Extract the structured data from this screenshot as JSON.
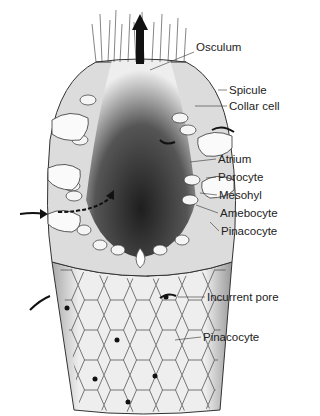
{
  "diagram": {
    "labels": [
      {
        "id": "osculum",
        "text": "Osculum",
        "x": 196,
        "y": 47
      },
      {
        "id": "spicule",
        "text": "Spicule",
        "x": 229,
        "y": 86
      },
      {
        "id": "collar-cell",
        "text": "Collar cell",
        "x": 229,
        "y": 102
      },
      {
        "id": "atrium",
        "text": "Atrium",
        "x": 218,
        "y": 155
      },
      {
        "id": "porocyte",
        "text": "Porocyte",
        "x": 218,
        "y": 173
      },
      {
        "id": "mesohyl",
        "text": "Mesohyl",
        "x": 219,
        "y": 191
      },
      {
        "id": "amebocyte",
        "text": "Amebocyte",
        "x": 220,
        "y": 209
      },
      {
        "id": "pinacocyte-upper",
        "text": "Pinacocyte",
        "x": 221,
        "y": 227
      },
      {
        "id": "incurrent-pore",
        "text": "Incurrent pore",
        "x": 207,
        "y": 293
      },
      {
        "id": "pinacocyte-lower",
        "text": "Pinacocyte",
        "x": 203,
        "y": 333
      }
    ],
    "colors": {
      "ink": "#222222",
      "cavity_dark": "#2a2a2a",
      "tissue": "#d9d9d9",
      "background": "#ffffff"
    }
  }
}
